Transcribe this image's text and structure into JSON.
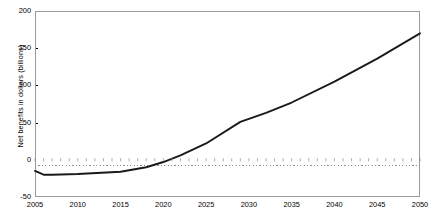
{
  "chart_data": {
    "type": "line",
    "title": "",
    "xlabel": "",
    "ylabel": "Net benefits in dollars (billions)",
    "xlim": [
      2005,
      2050
    ],
    "ylim": [
      -50,
      200
    ],
    "grid": false,
    "legend": null,
    "zero_line": true,
    "xticks": [
      "2005",
      "2010",
      "2015",
      "2020",
      "2025",
      "2030",
      "2035",
      "2040",
      "2045",
      "2050"
    ],
    "yticks": [
      "200",
      "150",
      "100",
      "50",
      "0",
      "-50"
    ],
    "ytick_values": [
      200,
      150,
      100,
      50,
      0,
      -50
    ],
    "xtick_values": [
      2005,
      2010,
      2015,
      2020,
      2025,
      2030,
      2035,
      2040,
      2045,
      2050
    ],
    "series": [
      {
        "name": "Net benefits",
        "color": "#1a1a1a",
        "x": [
          2005,
          2006,
          2007,
          2010,
          2015,
          2018,
          2020,
          2022,
          2025,
          2029,
          2032,
          2035,
          2040,
          2045,
          2050
        ],
        "values": [
          -15,
          -20,
          -20,
          -19,
          -16,
          -10,
          -3,
          6,
          22,
          51,
          63,
          77,
          105,
          136,
          170
        ]
      }
    ]
  }
}
